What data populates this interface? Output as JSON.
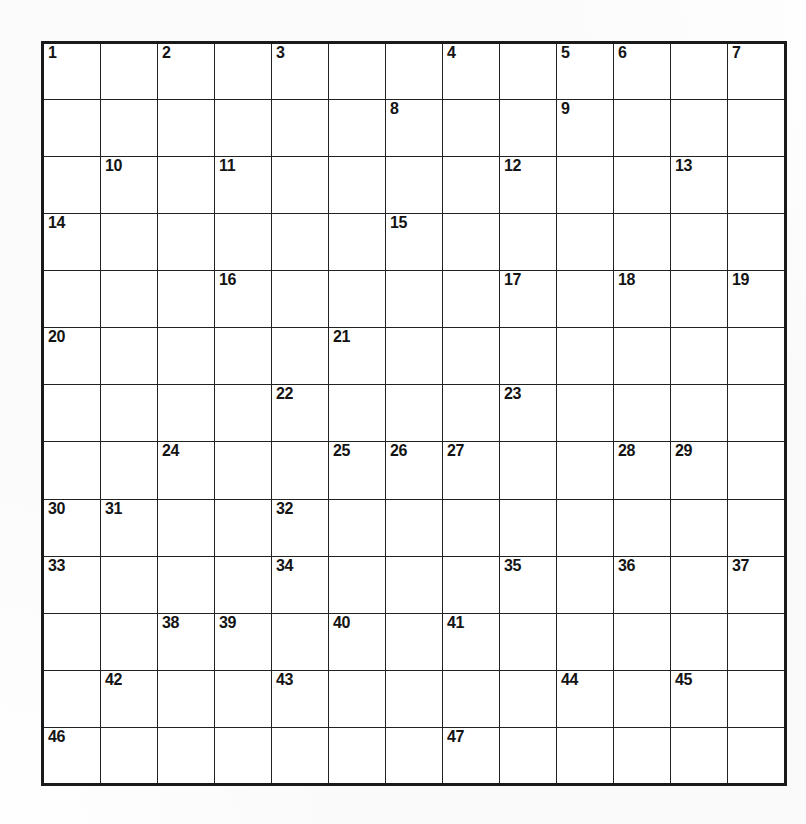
{
  "puzzle": {
    "title": "Crossword Puzzle Grid",
    "columns": 13,
    "rows": 13,
    "block_color": "#2b2b2b",
    "light_color": "#fdfdfd",
    "border_color": "#222222",
    "number_color": "#141414",
    "numbers_shown": [
      1,
      2,
      3,
      4,
      5,
      6,
      7,
      8,
      9,
      10,
      11,
      12,
      13,
      14,
      15,
      16,
      17,
      18,
      19,
      20,
      21,
      22,
      23,
      24,
      25,
      26,
      27,
      28,
      29,
      30,
      31,
      32,
      33,
      34,
      35,
      36,
      37,
      38,
      39,
      40,
      41,
      42,
      43,
      44,
      45,
      46,
      47
    ],
    "max_number": 47,
    "grid": [
      [
        {
          "type": "light",
          "number": "1"
        },
        {
          "type": "light",
          "number": ""
        },
        {
          "type": "light",
          "number": "2"
        },
        {
          "type": "block",
          "number": ""
        },
        {
          "type": "light",
          "number": "3"
        },
        {
          "type": "light",
          "number": ""
        },
        {
          "type": "block",
          "number": ""
        },
        {
          "type": "light",
          "number": "4"
        },
        {
          "type": "light",
          "number": ""
        },
        {
          "type": "light",
          "number": "5"
        },
        {
          "type": "light",
          "number": "6"
        },
        {
          "type": "light",
          "number": ""
        },
        {
          "type": "light",
          "number": "7"
        }
      ],
      [
        {
          "type": "light",
          "number": ""
        },
        {
          "type": "block",
          "number": ""
        },
        {
          "type": "light",
          "number": ""
        },
        {
          "type": "block",
          "number": ""
        },
        {
          "type": "light",
          "number": ""
        },
        {
          "type": "block",
          "number": ""
        },
        {
          "type": "light",
          "number": "8"
        },
        {
          "type": "light",
          "number": ""
        },
        {
          "type": "block",
          "number": ""
        },
        {
          "type": "light",
          "number": "9"
        },
        {
          "type": "light",
          "number": ""
        },
        {
          "type": "block",
          "number": ""
        },
        {
          "type": "light",
          "number": ""
        }
      ],
      [
        {
          "type": "block",
          "number": ""
        },
        {
          "type": "light",
          "number": "10"
        },
        {
          "type": "light",
          "number": ""
        },
        {
          "type": "light",
          "number": "11"
        },
        {
          "type": "light",
          "number": ""
        },
        {
          "type": "light",
          "number": ""
        },
        {
          "type": "block",
          "number": ""
        },
        {
          "type": "block",
          "number": ""
        },
        {
          "type": "light",
          "number": "12"
        },
        {
          "type": "light",
          "number": ""
        },
        {
          "type": "light",
          "number": ""
        },
        {
          "type": "light",
          "number": "13"
        },
        {
          "type": "block",
          "number": ""
        }
      ],
      [
        {
          "type": "light",
          "number": "14"
        },
        {
          "type": "light",
          "number": ""
        },
        {
          "type": "block",
          "number": ""
        },
        {
          "type": "light",
          "number": ""
        },
        {
          "type": "block",
          "number": ""
        },
        {
          "type": "block",
          "number": ""
        },
        {
          "type": "light",
          "number": "15"
        },
        {
          "type": "light",
          "number": ""
        },
        {
          "type": "light",
          "number": ""
        },
        {
          "type": "block",
          "number": ""
        },
        {
          "type": "block",
          "number": ""
        },
        {
          "type": "light",
          "number": ""
        },
        {
          "type": "block",
          "number": ""
        }
      ],
      [
        {
          "type": "block",
          "number": ""
        },
        {
          "type": "light",
          "number": ""
        },
        {
          "type": "block",
          "number": ""
        },
        {
          "type": "light",
          "number": "16"
        },
        {
          "type": "light",
          "number": ""
        },
        {
          "type": "block",
          "number": ""
        },
        {
          "type": "light",
          "number": ""
        },
        {
          "type": "block",
          "number": ""
        },
        {
          "type": "light",
          "number": "17"
        },
        {
          "type": "light",
          "number": ""
        },
        {
          "type": "light",
          "number": "18"
        },
        {
          "type": "light",
          "number": ""
        },
        {
          "type": "light",
          "number": "19"
        }
      ],
      [
        {
          "type": "light",
          "number": "20"
        },
        {
          "type": "light",
          "number": ""
        },
        {
          "type": "light",
          "number": ""
        },
        {
          "type": "light",
          "number": ""
        },
        {
          "type": "block",
          "number": ""
        },
        {
          "type": "light",
          "number": "21"
        },
        {
          "type": "light",
          "number": ""
        },
        {
          "type": "light",
          "number": ""
        },
        {
          "type": "light",
          "number": ""
        },
        {
          "type": "block",
          "number": ""
        },
        {
          "type": "light",
          "number": ""
        },
        {
          "type": "block",
          "number": ""
        },
        {
          "type": "light",
          "number": ""
        }
      ],
      [
        {
          "type": "light",
          "number": ""
        },
        {
          "type": "block",
          "number": ""
        },
        {
          "type": "block",
          "number": ""
        },
        {
          "type": "block",
          "number": ""
        },
        {
          "type": "light",
          "number": "22"
        },
        {
          "type": "block",
          "number": ""
        },
        {
          "type": "block",
          "number": ""
        },
        {
          "type": "block",
          "number": ""
        },
        {
          "type": "light",
          "number": "23"
        },
        {
          "type": "light",
          "number": ""
        },
        {
          "type": "light",
          "number": ""
        },
        {
          "type": "block",
          "number": ""
        },
        {
          "type": "light",
          "number": ""
        }
      ],
      [
        {
          "type": "light",
          "number": ""
        },
        {
          "type": "block",
          "number": ""
        },
        {
          "type": "light",
          "number": "24"
        },
        {
          "type": "light",
          "number": ""
        },
        {
          "type": "light",
          "number": ""
        },
        {
          "type": "light",
          "number": "25"
        },
        {
          "type": "light",
          "number": "26"
        },
        {
          "type": "light",
          "number": "27"
        },
        {
          "type": "light",
          "number": ""
        },
        {
          "type": "block",
          "number": ""
        },
        {
          "type": "light",
          "number": "28"
        },
        {
          "type": "light",
          "number": "29"
        },
        {
          "type": "light",
          "number": ""
        }
      ],
      [
        {
          "type": "light",
          "number": "30"
        },
        {
          "type": "light",
          "number": "31"
        },
        {
          "type": "light",
          "number": ""
        },
        {
          "type": "block",
          "number": ""
        },
        {
          "type": "light",
          "number": "32"
        },
        {
          "type": "light",
          "number": ""
        },
        {
          "type": "light",
          "number": ""
        },
        {
          "type": "light",
          "number": ""
        },
        {
          "type": "light",
          "number": ""
        },
        {
          "type": "block",
          "number": ""
        },
        {
          "type": "block",
          "number": ""
        },
        {
          "type": "light",
          "number": ""
        },
        {
          "type": "block",
          "number": ""
        }
      ],
      [
        {
          "type": "light",
          "number": "33"
        },
        {
          "type": "light",
          "number": ""
        },
        {
          "type": "light",
          "number": ""
        },
        {
          "type": "block",
          "number": ""
        },
        {
          "type": "light",
          "number": "34"
        },
        {
          "type": "light",
          "number": ""
        },
        {
          "type": "light",
          "number": ""
        },
        {
          "type": "block",
          "number": ""
        },
        {
          "type": "light",
          "number": "35"
        },
        {
          "type": "light",
          "number": ""
        },
        {
          "type": "light",
          "number": "36"
        },
        {
          "type": "light",
          "number": ""
        },
        {
          "type": "light",
          "number": "37"
        }
      ],
      [
        {
          "type": "block",
          "number": ""
        },
        {
          "type": "block",
          "number": ""
        },
        {
          "type": "light",
          "number": "38"
        },
        {
          "type": "light",
          "number": "39"
        },
        {
          "type": "block",
          "number": ""
        },
        {
          "type": "light",
          "number": "40"
        },
        {
          "type": "light",
          "number": ""
        },
        {
          "type": "light",
          "number": "41"
        },
        {
          "type": "light",
          "number": ""
        },
        {
          "type": "block",
          "number": ""
        },
        {
          "type": "light",
          "number": ""
        },
        {
          "type": "block",
          "number": ""
        },
        {
          "type": "light",
          "number": ""
        }
      ],
      [
        {
          "type": "block",
          "number": ""
        },
        {
          "type": "light",
          "number": "42"
        },
        {
          "type": "light",
          "number": ""
        },
        {
          "type": "light",
          "number": ""
        },
        {
          "type": "light",
          "number": "43"
        },
        {
          "type": "light",
          "number": ""
        },
        {
          "type": "block",
          "number": ""
        },
        {
          "type": "light",
          "number": ""
        },
        {
          "type": "block",
          "number": ""
        },
        {
          "type": "light",
          "number": "44"
        },
        {
          "type": "block",
          "number": ""
        },
        {
          "type": "light",
          "number": "45"
        },
        {
          "type": "light",
          "number": ""
        }
      ],
      [
        {
          "type": "light",
          "number": "46"
        },
        {
          "type": "light",
          "number": ""
        },
        {
          "type": "light",
          "number": ""
        },
        {
          "type": "block",
          "number": ""
        },
        {
          "type": "light",
          "number": ""
        },
        {
          "type": "block",
          "number": ""
        },
        {
          "type": "block",
          "number": ""
        },
        {
          "type": "light",
          "number": "47"
        },
        {
          "type": "light",
          "number": ""
        },
        {
          "type": "light",
          "number": ""
        },
        {
          "type": "light",
          "number": ""
        },
        {
          "type": "block",
          "number": ""
        },
        {
          "type": "light",
          "number": ""
        }
      ]
    ]
  }
}
